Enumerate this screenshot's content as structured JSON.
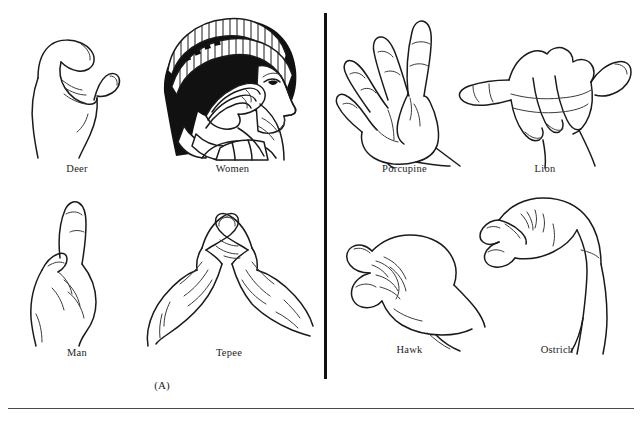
{
  "figure": {
    "panels": [
      {
        "id": "A",
        "caption": "(A)",
        "signs": [
          {
            "label": "Deer",
            "icon": "hand-deer-sign"
          },
          {
            "label": "Women",
            "icon": "head-women-sign"
          },
          {
            "label": "Man",
            "icon": "hand-man-sign"
          },
          {
            "label": "Tepee",
            "icon": "hands-tepee-sign"
          }
        ]
      },
      {
        "id": "B",
        "caption": "(B)",
        "signs": [
          {
            "label": "Porcupine",
            "icon": "hand-porcupine-sign"
          },
          {
            "label": "Lion",
            "icon": "hand-lion-sign"
          },
          {
            "label": "Hawk",
            "icon": "hand-hawk-sign"
          },
          {
            "label": "Ostrich",
            "icon": "hand-ostrich-sign"
          }
        ]
      }
    ],
    "colors": {
      "ink": "#1a1a1a",
      "paper": "#ffffff",
      "divider": "#111111",
      "rule": "#4a4a4a"
    }
  }
}
